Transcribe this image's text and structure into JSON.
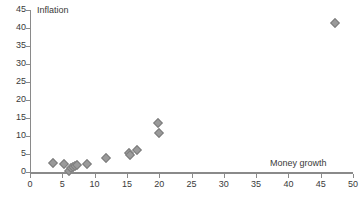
{
  "chart_data": {
    "type": "scatter",
    "title": "",
    "xlabel": "Money growth",
    "ylabel": "Inflation",
    "xlim": [
      0,
      50
    ],
    "ylim": [
      0,
      45
    ],
    "xticks": [
      0,
      5,
      10,
      15,
      20,
      25,
      30,
      35,
      40,
      45,
      50
    ],
    "yticks": [
      0,
      5,
      10,
      15,
      20,
      25,
      30,
      35,
      40,
      45
    ],
    "grid": false,
    "legend": null,
    "marker": "diamond",
    "marker_color": "#9a9a9a",
    "axis_color": "#8a8a8a",
    "series": [
      {
        "name": "Countries",
        "points": [
          {
            "x": 3.6,
            "y": 2.4
          },
          {
            "x": 5.2,
            "y": 2.2
          },
          {
            "x": 6.1,
            "y": 0.3
          },
          {
            "x": 6.3,
            "y": 1.0
          },
          {
            "x": 6.6,
            "y": 1.5
          },
          {
            "x": 6.9,
            "y": 1.8
          },
          {
            "x": 7.3,
            "y": 2.0
          },
          {
            "x": 8.9,
            "y": 2.3
          },
          {
            "x": 11.8,
            "y": 3.9
          },
          {
            "x": 15.3,
            "y": 5.4
          },
          {
            "x": 15.5,
            "y": 4.6
          },
          {
            "x": 16.6,
            "y": 6.0
          },
          {
            "x": 19.8,
            "y": 13.6
          },
          {
            "x": 20.0,
            "y": 10.7
          },
          {
            "x": 47.2,
            "y": 41.3
          }
        ]
      }
    ]
  }
}
